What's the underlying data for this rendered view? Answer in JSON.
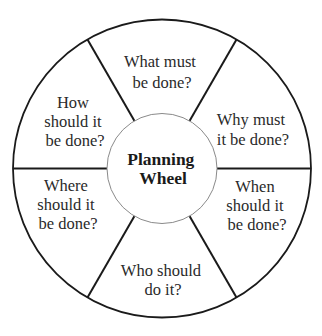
{
  "diagram": {
    "title": "Planning Wheel",
    "center_label": {
      "line1": "Planning",
      "line2": "Wheel"
    },
    "colors": {
      "background": "#ffffff",
      "outer_stroke": "#1a1a1a",
      "divider_stroke": "#1a1a1a",
      "inner_stroke": "#8a8a8a",
      "text": "#2a2a2a"
    },
    "segments": [
      {
        "id": "what",
        "position": "top",
        "lines": [
          "What must",
          "be done?"
        ]
      },
      {
        "id": "why",
        "position": "upper-right",
        "lines": [
          "Why must",
          "it be done?"
        ]
      },
      {
        "id": "when",
        "position": "lower-right",
        "lines": [
          "When",
          "should it",
          "be done?"
        ]
      },
      {
        "id": "who",
        "position": "bottom",
        "lines": [
          "Who should",
          "do it?"
        ]
      },
      {
        "id": "where",
        "position": "lower-left",
        "lines": [
          "Where",
          "should it",
          "be done?"
        ]
      },
      {
        "id": "how",
        "position": "upper-left",
        "lines": [
          "How",
          "should it",
          "be done?"
        ]
      }
    ]
  }
}
